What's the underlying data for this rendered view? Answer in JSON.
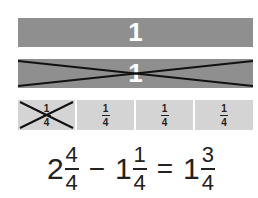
{
  "diagram": {
    "whole_bar": {
      "label": "1",
      "color": "#8f8f8f",
      "crossed_out": false
    },
    "crossed_bar": {
      "label": "1",
      "color": "#8f8f8f",
      "crossed_out": true
    },
    "quarter_bars": [
      {
        "numerator": "1",
        "denominator": "4",
        "crossed_out": true
      },
      {
        "numerator": "1",
        "denominator": "4",
        "crossed_out": false
      },
      {
        "numerator": "1",
        "denominator": "4",
        "crossed_out": false
      },
      {
        "numerator": "1",
        "denominator": "4",
        "crossed_out": false
      }
    ],
    "quarter_color": "#d4d4d4",
    "equation": {
      "term1": {
        "whole": "2",
        "numerator": "4",
        "denominator": "4"
      },
      "operator1": "−",
      "term2": {
        "whole": "1",
        "numerator": "1",
        "denominator": "4"
      },
      "operator2": "=",
      "result": {
        "whole": "1",
        "numerator": "3",
        "denominator": "4"
      }
    }
  }
}
